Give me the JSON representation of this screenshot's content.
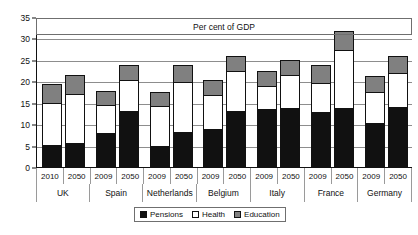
{
  "chart_data": {
    "type": "bar",
    "title": "Per cent of GDP",
    "xlabel": "",
    "ylabel": "",
    "ylim": [
      0,
      35
    ],
    "yticks": [
      0,
      5,
      10,
      15,
      20,
      25,
      30,
      35
    ],
    "grid": true,
    "stacked": true,
    "legend_position": "bottom-center",
    "legend": [
      "Pensions",
      "Health",
      "Education"
    ],
    "series_colors": {
      "Pensions": "#111111",
      "Health": "#ffffff",
      "Education": "#808080"
    },
    "groups": [
      {
        "country": "UK",
        "bars": [
          {
            "year": "2010",
            "pensions": 5.2,
            "health": 9.8,
            "education": 4.3,
            "total": 19.3
          },
          {
            "year": "2050",
            "pensions": 5.5,
            "health": 11.6,
            "education": 4.4,
            "total": 21.5
          }
        ]
      },
      {
        "country": "Spain",
        "bars": [
          {
            "year": "2009",
            "pensions": 8.0,
            "health": 6.4,
            "education": 3.3,
            "total": 17.7
          },
          {
            "year": "2050",
            "pensions": 13.0,
            "health": 7.2,
            "education": 3.6,
            "total": 23.8
          }
        ]
      },
      {
        "country": "Netherlands",
        "bars": [
          {
            "year": "2009",
            "pensions": 5.0,
            "health": 9.2,
            "education": 3.4,
            "total": 17.6
          },
          {
            "year": "2050",
            "pensions": 8.2,
            "health": 11.6,
            "education": 4.0,
            "total": 23.8
          }
        ]
      },
      {
        "country": "Belgium",
        "bars": [
          {
            "year": "2009",
            "pensions": 8.8,
            "health": 8.0,
            "education": 3.4,
            "total": 20.2
          },
          {
            "year": "2050",
            "pensions": 13.0,
            "health": 9.4,
            "education": 3.4,
            "total": 25.8
          }
        ]
      },
      {
        "country": "Italy",
        "bars": [
          {
            "year": "2009",
            "pensions": 13.5,
            "health": 5.4,
            "education": 3.4,
            "total": 22.3
          },
          {
            "year": "2050",
            "pensions": 13.8,
            "health": 7.7,
            "education": 3.4,
            "total": 24.9
          }
        ]
      },
      {
        "country": "France",
        "bars": [
          {
            "year": "2009",
            "pensions": 12.8,
            "health": 6.9,
            "education": 4.1,
            "total": 23.8
          },
          {
            "year": "2050",
            "pensions": 13.8,
            "health": 13.5,
            "education": 4.5,
            "total": 31.8
          }
        ]
      },
      {
        "country": "Germany",
        "bars": [
          {
            "year": "2009",
            "pensions": 10.2,
            "health": 7.3,
            "education": 3.7,
            "total": 21.2
          },
          {
            "year": "2050",
            "pensions": 14.0,
            "health": 8.0,
            "education": 3.8,
            "total": 25.8
          }
        ]
      }
    ]
  }
}
